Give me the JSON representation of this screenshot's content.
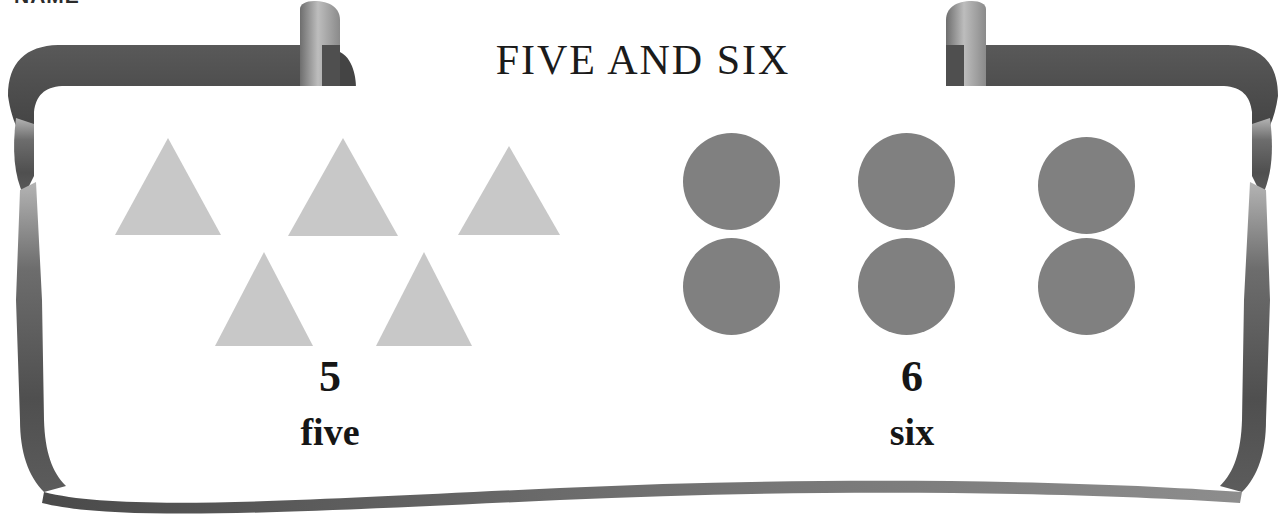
{
  "page": {
    "title": "FIVE AND SIX",
    "name_field_label": "NAME",
    "background_color": "#ffffff"
  },
  "frame": {
    "ribbon_color_dark": "#4a4a4a",
    "ribbon_color_mid": "#5e5e5e",
    "ribbon_color_light": "#a6a6a6",
    "curl_highlight": "#b9b9b9"
  },
  "groups": [
    {
      "id": "five",
      "numeral": "5",
      "word": "five",
      "shape_name": "triangle",
      "shape_count": 5,
      "shape_color": "#c8c8c8",
      "shapes": [
        {
          "x": 25,
          "y": 18,
          "w": 106,
          "h": 97
        },
        {
          "x": 198,
          "y": 18,
          "w": 110,
          "h": 98
        },
        {
          "x": 368,
          "y": 26,
          "w": 102,
          "h": 89
        },
        {
          "x": 125,
          "y": 132,
          "w": 98,
          "h": 94
        },
        {
          "x": 286,
          "y": 132,
          "w": 96,
          "h": 94
        }
      ]
    },
    {
      "id": "six",
      "numeral": "6",
      "word": "six",
      "shape_name": "circle",
      "shape_count": 6,
      "shape_color": "#808080",
      "shapes": [
        {
          "x": 18,
          "y": 13,
          "d": 97
        },
        {
          "x": 193,
          "y": 13,
          "d": 97
        },
        {
          "x": 373,
          "y": 17,
          "d": 97
        },
        {
          "x": 18,
          "y": 118,
          "d": 97
        },
        {
          "x": 193,
          "y": 118,
          "d": 97
        },
        {
          "x": 373,
          "y": 118,
          "d": 97
        }
      ]
    }
  ],
  "chart_data": {
    "type": "bar",
    "title": "FIVE AND SIX",
    "categories": [
      "five",
      "six"
    ],
    "values": [
      5,
      6
    ],
    "xlabel": "",
    "ylabel": "count",
    "ylim": [
      0,
      6
    ]
  }
}
